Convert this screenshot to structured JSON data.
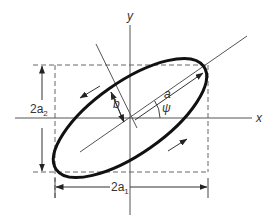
{
  "diagram": {
    "axes": {
      "x_label": "x",
      "y_label": "y"
    },
    "labels": {
      "semi_major": "a",
      "semi_minor": "b",
      "angle": "ψ",
      "height_base": "2a",
      "height_sub": "2",
      "width_base": "2a",
      "width_sub": "1"
    },
    "colors": {
      "ellipse": "#111111",
      "lines": "#444444",
      "dashed": "#666666",
      "text": "#333333",
      "background": "#ffffff"
    },
    "geometry": {
      "center": [
        130,
        118
      ],
      "tilt_deg": 35,
      "rect": {
        "x1": 55,
        "y1": 65,
        "x2": 208,
        "y2": 172
      }
    }
  }
}
